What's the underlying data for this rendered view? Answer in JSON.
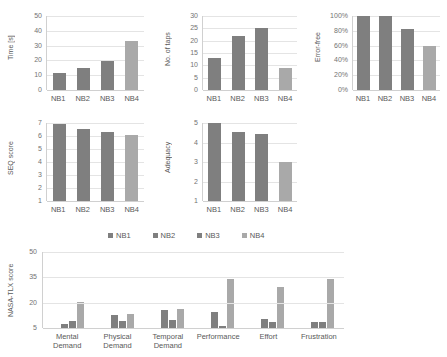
{
  "series_names": [
    "NB1",
    "NB2",
    "NB3",
    "NB4"
  ],
  "colors": {
    "bar_dark": "#7f7f7f",
    "bar_light": "#a9a9a9",
    "gridline": "#e4e4e4",
    "axis": "#d0d0d0",
    "text": "#595959"
  },
  "legend": {
    "items": [
      {
        "label": "NB1",
        "color": "#7f7f7f"
      },
      {
        "label": "NB2",
        "color": "#7f7f7f"
      },
      {
        "label": "NB3",
        "color": "#7f7f7f"
      },
      {
        "label": "NB4",
        "color": "#a9a9a9"
      }
    ]
  },
  "chart_data": [
    {
      "id": "time",
      "type": "bar",
      "title": "",
      "ylabel": "Time [s]",
      "xlabel": "",
      "categories": [
        "NB1",
        "NB2",
        "NB3",
        "NB4"
      ],
      "values": [
        11.5,
        15.0,
        19.5,
        33.0
      ],
      "yticks": [
        0,
        10,
        20,
        30,
        40,
        50
      ],
      "ylim": [
        0,
        50
      ],
      "grid": true,
      "legend_position": "none"
    },
    {
      "id": "taps",
      "type": "bar",
      "title": "",
      "ylabel": "No. of taps",
      "xlabel": "",
      "categories": [
        "NB1",
        "NB2",
        "NB3",
        "NB4"
      ],
      "values": [
        13.0,
        22.0,
        25.0,
        8.8
      ],
      "yticks": [
        0,
        5,
        10,
        15,
        20,
        25,
        30
      ],
      "ylim": [
        0,
        30
      ],
      "grid": true,
      "legend_position": "none"
    },
    {
      "id": "error-free",
      "type": "bar",
      "title": "",
      "ylabel": "Error-free",
      "xlabel": "",
      "categories": [
        "NB1",
        "NB2",
        "NB3",
        "NB4"
      ],
      "values": [
        100,
        100,
        82,
        60
      ],
      "yticks": [
        "0%",
        "20%",
        "40%",
        "60%",
        "80%",
        "100%"
      ],
      "ylim": [
        0,
        100
      ],
      "grid": true,
      "legend_position": "none"
    },
    {
      "id": "seq",
      "type": "bar",
      "title": "",
      "ylabel": "SEQ score",
      "xlabel": "",
      "categories": [
        "NB1",
        "NB2",
        "NB3",
        "NB4"
      ],
      "values": [
        6.95,
        6.55,
        6.3,
        6.1
      ],
      "yticks": [
        1,
        2,
        3,
        4,
        5,
        6,
        7
      ],
      "ylim": [
        1,
        7
      ],
      "grid": true,
      "legend_position": "none"
    },
    {
      "id": "adequacy",
      "type": "bar",
      "title": "",
      "ylabel": "Adequacy",
      "xlabel": "",
      "categories": [
        "NB1",
        "NB2",
        "NB3",
        "NB4"
      ],
      "values": [
        5.0,
        4.55,
        4.45,
        3.0
      ],
      "yticks": [
        1,
        2,
        3,
        4,
        5
      ],
      "ylim": [
        1,
        5
      ],
      "grid": true,
      "legend_position": "none"
    },
    {
      "id": "nasa-tlx",
      "type": "bar",
      "title": "",
      "ylabel": "NASA-TLX score",
      "xlabel": "",
      "categories": [
        "Mental Demand",
        "Physical Demand",
        "Temporal Demand",
        "Performance",
        "Effort",
        "Frustration"
      ],
      "series": [
        {
          "name": "NB1",
          "values": [
            5.3,
            5.0,
            5.0,
            5.0,
            5.0,
            5.0
          ]
        },
        {
          "name": "NB2",
          "values": [
            7.5,
            12.5,
            15.5,
            14.5,
            10.5,
            8.5
          ]
        },
        {
          "name": "NB3",
          "values": [
            9.0,
            9.0,
            9.5,
            6.0,
            8.5,
            8.5
          ]
        },
        {
          "name": "NB4",
          "values": [
            20.5,
            13.5,
            16.0,
            34.0,
            29.0,
            34.0
          ]
        }
      ],
      "yticks": [
        5,
        20,
        35,
        50
      ],
      "ylim": [
        5,
        50
      ],
      "grid": true,
      "legend_position": "top"
    }
  ]
}
